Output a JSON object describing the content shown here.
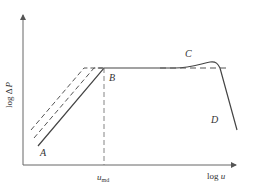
{
  "diagram": {
    "type": "log-log characteristic curve",
    "axes": {
      "y_label_prefix": "log",
      "y_label_symbol": "Δ",
      "y_label_var": "P",
      "x_label_prefix": "log",
      "x_label_var": "u"
    },
    "points": {
      "A": "A",
      "B": "B",
      "C": "C",
      "D": "D"
    },
    "x_marker": {
      "var": "u",
      "subscript": "md"
    },
    "colors": {
      "line": "#444444",
      "axis": "#666666",
      "text": "#333333"
    }
  }
}
